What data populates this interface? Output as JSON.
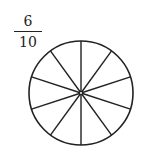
{
  "fraction": {
    "numerator": "6",
    "denominator": "10"
  },
  "circle": {
    "center": [
      81,
      93
    ],
    "radius": 52,
    "divisions": 10,
    "shaded": 0,
    "stroke": "#222222",
    "fill": "#ffffff"
  }
}
